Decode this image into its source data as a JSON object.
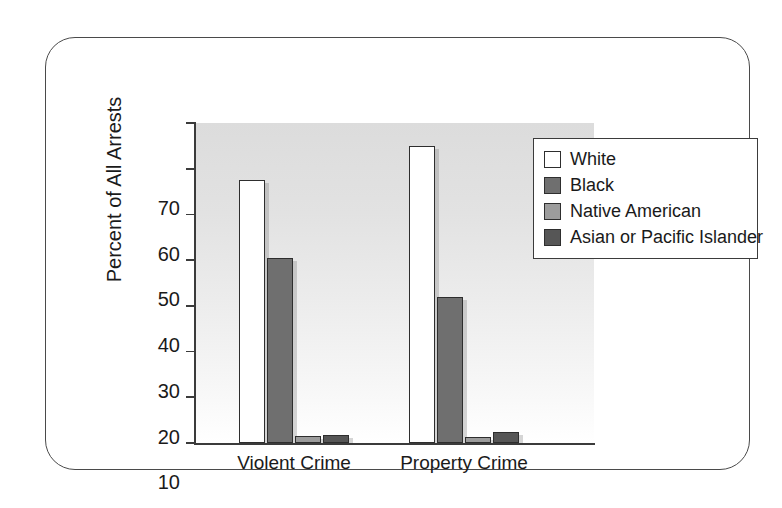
{
  "chart_data": {
    "type": "bar",
    "title": "",
    "subtitle": "",
    "xlabel": "",
    "ylabel": "Percent of All Arrests",
    "categories": [
      "Violent Crime",
      "Property Crime"
    ],
    "series": [
      {
        "name": "White",
        "color": "#ffffff",
        "values": [
          57.5,
          65.0
        ]
      },
      {
        "name": "Black",
        "color": "#6f6f6f",
        "values": [
          40.5,
          32.0
        ]
      },
      {
        "name": "Native American",
        "color": "#9c9c9c",
        "values": [
          1.5,
          1.3
        ]
      },
      {
        "name": "Asian or Pacific Islander",
        "color": "#565656",
        "values": [
          1.8,
          2.5
        ]
      }
    ],
    "ylim": [
      0,
      70
    ],
    "yticks": [
      0,
      10,
      20,
      30,
      40,
      50,
      60,
      70
    ],
    "ytick_labels": [
      "0",
      "10",
      "20",
      "30",
      "40",
      "50",
      "60",
      "70"
    ],
    "grid": false,
    "legend_position": "top-right",
    "plot_background": "vertical gradient light-gray to white",
    "axis_color": "#3b3b3b",
    "bar_edge_color": "#2e2e2e"
  },
  "legend": {
    "entries": [
      {
        "label": "White",
        "swatch": "#ffffff"
      },
      {
        "label": "Black",
        "swatch": "#6f6f6f"
      },
      {
        "label": "Native American",
        "swatch": "#9c9c9c"
      },
      {
        "label": "Asian or Pacific Islander",
        "swatch": "#565656"
      }
    ]
  },
  "axes": {
    "y_title": "Percent of All Arrests",
    "y_labels": [
      "70",
      "60",
      "50",
      "40",
      "30",
      "20",
      "10",
      "0"
    ],
    "x_labels": [
      "Violent Crime",
      "Property Crime"
    ]
  }
}
